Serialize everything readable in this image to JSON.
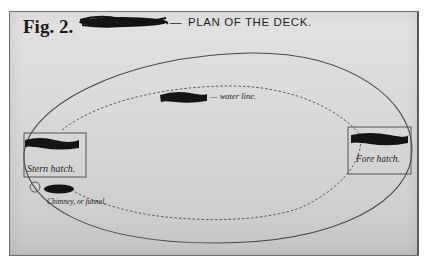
{
  "figure": {
    "label": "Fig. 2.",
    "title_dash": "—",
    "title": "PLAN OF THE DECK."
  },
  "annotations": {
    "water_line": "— water line.",
    "stern_hatch": "Stern hatch.",
    "fore_hatch": "Fore hatch.",
    "chimney": "Chimney, or funnel."
  },
  "redactions": [
    "title-redaction",
    "water-line-redaction",
    "stern-hatch-redaction",
    "fore-hatch-redaction",
    "chimney-redaction"
  ],
  "colors": {
    "ink": "#1a1a1a",
    "pencil": "#555555",
    "paper": "#dcdcdc",
    "frame": "#6f6f6f"
  }
}
